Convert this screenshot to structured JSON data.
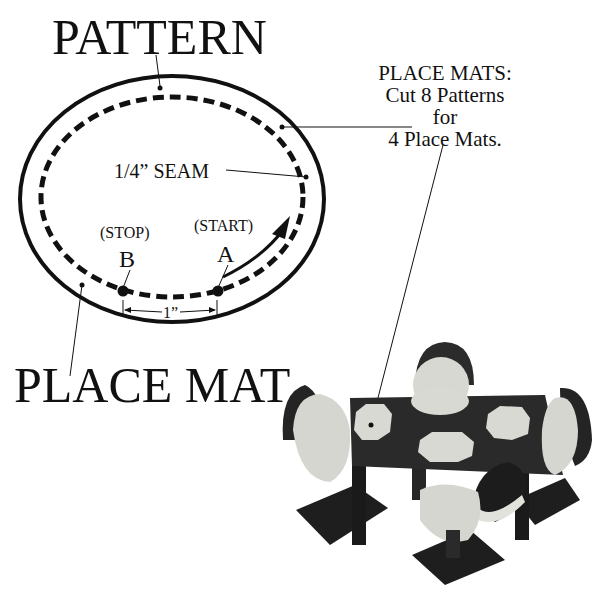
{
  "titles": {
    "pattern": "PATTERN",
    "place_mat": "PLACE MAT"
  },
  "labels": {
    "seam": "1/4” SEAM",
    "stop": "(STOP)",
    "start": "(START)",
    "point_b": "B",
    "point_a": "A",
    "gap": "1”"
  },
  "instructions": {
    "line1": "PLACE MATS:",
    "line2": "Cut 8 Patterns",
    "line3": "for",
    "line4": "4 Place Mats."
  },
  "photo": {
    "subject": "miniature dining table with four chairs and place mats"
  },
  "colors": {
    "ink": "#111111",
    "paper": "#ffffff",
    "wood": "#2a2a2a",
    "fabric": "#d9d9d4"
  }
}
